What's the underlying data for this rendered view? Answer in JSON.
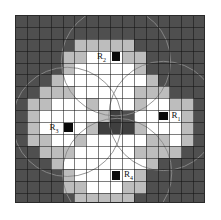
{
  "figure": {
    "kind": "voronoi-disc-raster-diagram",
    "background_color": "#ffffff",
    "plate_color": "#4f4f4f",
    "interior_color": "#ffffff",
    "boundary_color": "#bdbdbd",
    "seed_color": "#0a0a0a",
    "grid_line_color": "#1c1c1c",
    "arc_line_color": "#8a8a8a",
    "grid": {
      "cols": 16,
      "rows": 16,
      "cell_px": 11.875
    },
    "regions": [
      {
        "id": "R1",
        "label": "R",
        "sub": "1",
        "position": "right",
        "seed_col": 12,
        "seed_row": 8,
        "label_side": "right"
      },
      {
        "id": "R2",
        "label": "R",
        "sub": "2",
        "position": "top",
        "seed_col": 8,
        "seed_row": 3,
        "label_side": "left"
      },
      {
        "id": "R3",
        "label": "R",
        "sub": "3",
        "position": "left",
        "seed_col": 4,
        "seed_row": 9,
        "label_side": "left"
      },
      {
        "id": "R4",
        "label": "R",
        "sub": "4",
        "position": "bottom",
        "seed_col": 8,
        "seed_row": 13,
        "label_side": "right"
      }
    ],
    "discs": [
      {
        "id": "R1",
        "cx": 12.5,
        "cy": 8.5,
        "r": 4.6
      },
      {
        "id": "R2",
        "cx": 8.5,
        "cy": 3.9,
        "r": 4.6
      },
      {
        "id": "R3",
        "cx": 4.4,
        "cy": 9.0,
        "r": 4.6
      },
      {
        "id": "R4",
        "cx": 8.6,
        "cy": 13.3,
        "r": 4.6
      }
    ],
    "raster": {
      "legend": {
        "0": "background",
        "1": "boundary-gray",
        "2": "interior-white",
        "3": "center-dark"
      },
      "rows": [
        "0000000000000000",
        "0000000000000000",
        "0000011111000000",
        "0000112221100000",
        "0000122222100000",
        "0001222222210000",
        "0011122222111000",
        "0112221222122110",
        "0122222130222210",
        "0122221333122210",
        "0112212222211210",
        "0011122222111100",
        "0001222222210000",
        "0000122222100000",
        "0000112221100000",
        "0000011111000000"
      ]
    }
  }
}
